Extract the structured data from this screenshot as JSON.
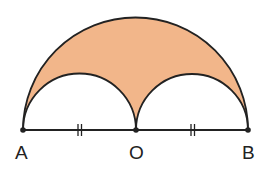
{
  "diagram": {
    "points": [
      {
        "label": "A",
        "x": 23,
        "y": 130
      },
      {
        "label": "O",
        "x": 136,
        "y": 130
      },
      {
        "label": "B",
        "x": 248,
        "y": 130
      }
    ],
    "equal_marks": "||",
    "colors": {
      "shaded_fill": "#F2B68A",
      "stroke": "#222222"
    }
  }
}
